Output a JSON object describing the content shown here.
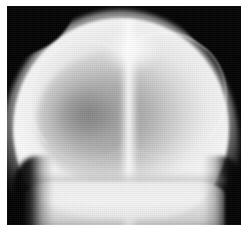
{
  "image": {
    "kind": "radiograph",
    "modality": "X-ray",
    "view": "skull anteroposterior (AP) / frontal projection",
    "subject": "cranium",
    "orientation": "upright, vertex at top",
    "colorspace": "grayscale",
    "width_px": 244,
    "height_px": 230,
    "border": {
      "name": "white-photographic-margin",
      "color": "#ffffff",
      "left_px": 7,
      "top_px": 6,
      "right_px": 3,
      "bottom_px": 5
    },
    "background": {
      "name": "unexposed-film-background",
      "color": "#030303"
    },
    "palette": {
      "background_black": "#030303",
      "bone_bright": "#fafafa",
      "vault_mid": "#e4e4e4",
      "cavity_gray": "#9a9a9a",
      "focal_dark_patch": "#7c7c7c",
      "margin_white": "#ffffff"
    },
    "regions": [
      {
        "name": "scalp-soft-tissue-halo",
        "description": "diffuse bright soft-tissue envelope outlining the scalp contour",
        "tone": "light gray to white"
      },
      {
        "name": "cranial-vault",
        "description": "dome-shaped calvarium occupying most of the frame, brightest along its periphery",
        "tone": "bright white-gray"
      },
      {
        "name": "cranial-cavity",
        "description": "large ovoid darker gray interior representing the intracranial contents",
        "tone": "mid gray"
      },
      {
        "name": "focal-dark-patch",
        "description": "irregular lower-attenuation patch left of midline within the cavity",
        "tone": "dark gray"
      },
      {
        "name": "sagittal-midline-band",
        "description": "vertical high-density stripe running the full height of the skull at the midline",
        "tone": "near white"
      },
      {
        "name": "vertex-highlight",
        "description": "brightest focus at the top of the vault just right of midline",
        "tone": "white"
      },
      {
        "name": "coronal-suture-arc-right",
        "description": "thin curved bright line arcing from the vertex down the right side",
        "tone": "white line"
      },
      {
        "name": "coronal-suture-arc-left",
        "description": "fainter mirrored curved line on the left side of the vault",
        "tone": "faint white line"
      },
      {
        "name": "transverse-shadow-band",
        "description": "horizontal band crossing the lower skull separating vault from base",
        "tone": "slightly darker gray"
      },
      {
        "name": "skull-base-block",
        "description": "broad bright band at the bottom continuing to the frame edge",
        "tone": "light gray"
      },
      {
        "name": "left-tissue-notch",
        "description": "black concavity at the lower left where background meets the tissue profile",
        "tone": "black"
      },
      {
        "name": "right-tissue-notch",
        "description": "black concavity at the lower right where background meets the tissue profile",
        "tone": "black"
      },
      {
        "name": "film-grain",
        "description": "fine horizontal scan-line texture across the whole exposure",
        "tone": "neutral"
      }
    ],
    "annotations": [],
    "visible_text": []
  }
}
